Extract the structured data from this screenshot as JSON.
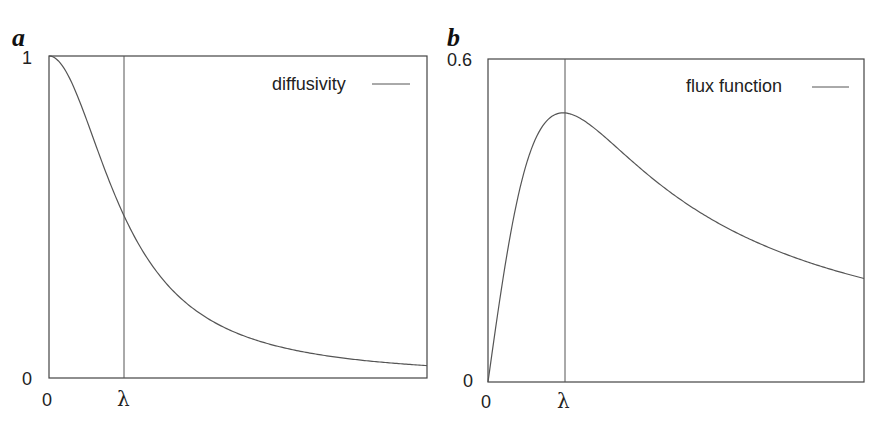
{
  "chart_data": [
    {
      "type": "line",
      "panel_label": "a",
      "title": "",
      "xlabel": "",
      "ylabel": "",
      "x_tick_labels": [
        "0",
        "λ"
      ],
      "y_tick_labels": [
        "0",
        "1"
      ],
      "ylim": [
        0,
        1
      ],
      "xlim_in_lambda": [
        0,
        5
      ],
      "lambda_marker": 1,
      "legend": [
        "diffusivity"
      ],
      "legend_position": "top-right",
      "grid": false,
      "series": [
        {
          "name": "diffusivity",
          "formula": "g(s) = 1 / (1 + (s/λ)^2)",
          "x_over_lambda": [
            0,
            0.25,
            0.5,
            0.75,
            1,
            1.5,
            2,
            2.5,
            3,
            3.5,
            4,
            4.5,
            5
          ],
          "values": [
            1,
            0.94,
            0.8,
            0.64,
            0.5,
            0.31,
            0.2,
            0.14,
            0.1,
            0.075,
            0.059,
            0.047,
            0.038
          ]
        }
      ]
    },
    {
      "type": "line",
      "panel_label": "b",
      "title": "",
      "xlabel": "",
      "ylabel": "",
      "x_tick_labels": [
        "0",
        "λ"
      ],
      "y_tick_labels": [
        "0",
        "0.6"
      ],
      "ylim": [
        0,
        0.6
      ],
      "xlim_in_lambda": [
        0,
        5
      ],
      "lambda_marker": 1,
      "legend": [
        "flux function"
      ],
      "legend_position": "top-right",
      "grid": false,
      "series": [
        {
          "name": "flux function",
          "formula": "φ(s) = s·g(s), peak 0.5 at s = λ",
          "x_over_lambda": [
            0,
            0.25,
            0.5,
            0.75,
            1,
            1.5,
            2,
            2.5,
            3,
            3.5,
            4,
            4.5,
            5
          ],
          "values": [
            0,
            0.235,
            0.4,
            0.48,
            0.5,
            0.46,
            0.4,
            0.345,
            0.3,
            0.264,
            0.235,
            0.211,
            0.192
          ]
        }
      ]
    }
  ],
  "panels": {
    "a": {
      "label": "a",
      "y_max_label": "1",
      "y_min_label": "0",
      "x_min_label": "0",
      "x_lambda_label": "λ",
      "legend_text": "diffusivity"
    },
    "b": {
      "label": "b",
      "y_max_label": "0.6",
      "y_min_label": "0",
      "x_min_label": "0",
      "x_lambda_label": "λ",
      "legend_text": "flux function"
    }
  }
}
